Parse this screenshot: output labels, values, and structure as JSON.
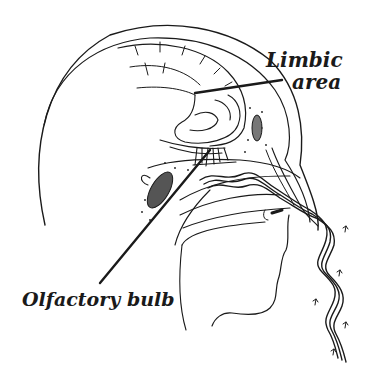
{
  "figure": {
    "background": "#ffffff",
    "ink_color": "#1a1a1a"
  },
  "labels": {
    "limbic_line1": "Limbic",
    "limbic_line2": "area",
    "olfactory": "Olfactory bulb"
  },
  "callouts": [
    {
      "label": "Limbic area",
      "from": [
        330,
        83
      ],
      "to": [
        195,
        93
      ]
    },
    {
      "label": "Olfactory bulb",
      "from": [
        100,
        283
      ],
      "to": [
        210,
        150
      ]
    }
  ],
  "structures": [
    "skull",
    "cerebrum",
    "limbic-area",
    "olfactory-bulb",
    "nasal-cavity",
    "sinus",
    "airflow-stream",
    "face-profile"
  ]
}
